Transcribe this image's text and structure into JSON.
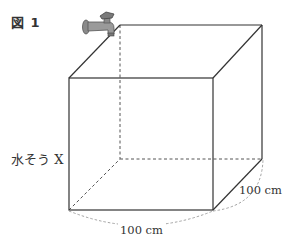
{
  "figure": {
    "label": "図 1",
    "tank_label": "水そう X",
    "dimensions": {
      "width": "100 cm",
      "depth": "100 cm"
    },
    "objects": [
      "faucet-icon",
      "cube-tank"
    ],
    "colors": {
      "line": "#333333",
      "dashed": "#666666",
      "faucet": "#7a7a7a"
    }
  }
}
